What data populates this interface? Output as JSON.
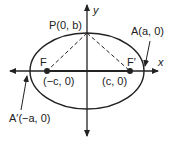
{
  "diagram": {
    "type": "ellipse-foci",
    "axes": {
      "x_label": "x",
      "y_label": "y"
    },
    "points": {
      "P": {
        "label": "P(0, b)"
      },
      "F": {
        "name": "F",
        "coord": "(−c, 0)"
      },
      "F_prime": {
        "name": "F′",
        "coord": "(c, 0)"
      },
      "A": {
        "label": "A(a, 0)"
      },
      "A_prime": {
        "label": "A′(−a, 0)"
      }
    },
    "colors": {
      "stroke": "#222222",
      "background": "#ffffff"
    }
  }
}
